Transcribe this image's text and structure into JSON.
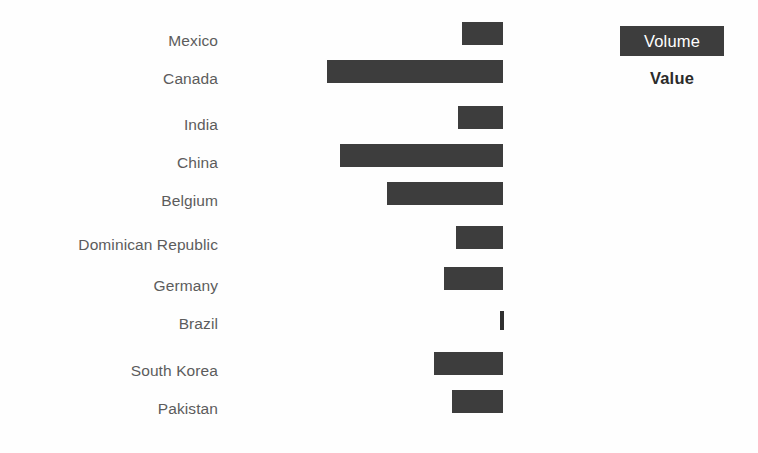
{
  "chart_data": {
    "type": "bar",
    "orientation": "horizontal",
    "title": "",
    "xlabel": "",
    "ylabel": "",
    "grid": false,
    "axis_visible": false,
    "tick_labels_visible": false,
    "bars_right_aligned_at_px": 503,
    "categories": [
      "Mexico",
      "Canada",
      "India",
      "China",
      "Belgium",
      "Dominican Republic",
      "Germany",
      "Brazil",
      "South Korea",
      "Pakistan"
    ],
    "series": [
      {
        "name": "Volume",
        "values": [
          41,
          176,
          45,
          163,
          116,
          47,
          59,
          4,
          69,
          51
        ]
      }
    ],
    "values": [
      41,
      176,
      45,
      163,
      116,
      47,
      59,
      4,
      69,
      51
    ],
    "xlim": [
      0,
      176
    ],
    "legend": {
      "position": "top-right",
      "entries": [
        {
          "label": "Volume",
          "style": "filled-chip",
          "color": "#3d3d3d",
          "text_color": "#ffffff"
        },
        {
          "label": "Value",
          "style": "plain-text",
          "color": "#2b2b2b"
        }
      ]
    },
    "colors": {
      "bar": "#3d3d3d",
      "label": "#5c5c5c",
      "background": "#fefefe"
    }
  },
  "rows": [
    {
      "label": "Mexico",
      "bar_left": 462,
      "bar_top": 22,
      "bar_width": 41,
      "label_top": 33
    },
    {
      "label": "Canada",
      "bar_left": 327,
      "bar_top": 60,
      "bar_width": 176,
      "label_top": 71
    },
    {
      "label": "India",
      "bar_left": 458,
      "bar_top": 106,
      "bar_width": 45,
      "label_top": 117
    },
    {
      "label": "China",
      "bar_left": 340,
      "bar_top": 144,
      "bar_width": 163,
      "label_top": 155
    },
    {
      "label": "Belgium",
      "bar_left": 387,
      "bar_top": 182,
      "bar_width": 116,
      "label_top": 193
    },
    {
      "label": "Dominican Republic",
      "bar_left": 456,
      "bar_top": 226,
      "bar_width": 47,
      "label_top": 237
    },
    {
      "label": "Germany",
      "bar_left": 444,
      "bar_top": 267,
      "bar_width": 59,
      "label_top": 278
    },
    {
      "label": "Brazil",
      "bar_left": 500,
      "bar_top": 311,
      "bar_width": 4,
      "label_top": 316
    },
    {
      "label": "South Korea",
      "bar_left": 434,
      "bar_top": 352,
      "bar_width": 69,
      "label_top": 363
    },
    {
      "label": "Pakistan",
      "bar_left": 452,
      "bar_top": 390,
      "bar_width": 51,
      "label_top": 401
    }
  ],
  "legend": {
    "volume_label": "Volume",
    "value_label": "Value"
  }
}
